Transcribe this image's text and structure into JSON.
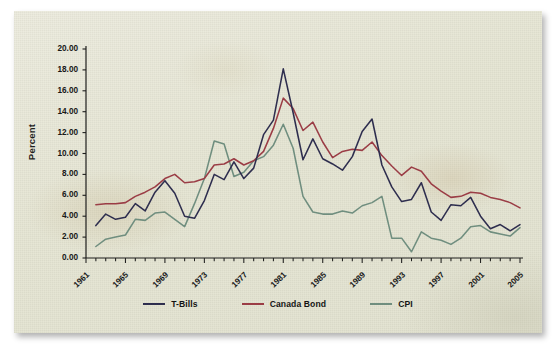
{
  "figure": {
    "background_color": "#e8e8d8",
    "y_axis_title": "Percent"
  },
  "legend": {
    "items": [
      {
        "label": "T-Bills",
        "color": "#2b2b4e"
      },
      {
        "label": "Canada Bond",
        "color": "#9c3a44"
      },
      {
        "label": "CPI",
        "color": "#6f8f80"
      }
    ]
  },
  "chart_data": {
    "type": "line",
    "title": "",
    "subtitle": "",
    "xlabel": "",
    "ylabel": "Percent",
    "ylim": [
      0,
      20
    ],
    "y_ticks": [
      "0.00",
      "2.00",
      "4.00",
      "6.00",
      "8.00",
      "10.00",
      "12.00",
      "14.00",
      "16.00",
      "18.00",
      "20.00"
    ],
    "xlim": [
      1961,
      2005
    ],
    "x_ticks_labeled": [
      "1961",
      "1965",
      "1969",
      "1973",
      "1977",
      "1981",
      "1985",
      "1989",
      "1993",
      "1997",
      "2001",
      "2005"
    ],
    "x_tick_interval_minor": 1,
    "grid": false,
    "legend_position": "bottom",
    "x": [
      1962,
      1963,
      1964,
      1965,
      1966,
      1967,
      1968,
      1969,
      1970,
      1971,
      1972,
      1973,
      1974,
      1975,
      1976,
      1977,
      1978,
      1979,
      1980,
      1981,
      1982,
      1983,
      1984,
      1985,
      1986,
      1987,
      1988,
      1989,
      1990,
      1991,
      1992,
      1993,
      1994,
      1995,
      1996,
      1997,
      1998,
      1999,
      2000,
      2001,
      2002,
      2003,
      2004,
      2005
    ],
    "series": [
      {
        "name": "T-Bills",
        "color": "#2b2b4e",
        "values": [
          3.1,
          4.2,
          3.7,
          3.9,
          5.2,
          4.5,
          6.3,
          7.4,
          6.2,
          4.0,
          3.8,
          5.5,
          8.0,
          7.5,
          9.2,
          7.6,
          8.6,
          11.8,
          13.2,
          18.1,
          13.9,
          9.4,
          11.4,
          9.5,
          9.0,
          8.4,
          9.7,
          12.1,
          13.3,
          8.9,
          6.8,
          5.4,
          5.6,
          7.2,
          4.4,
          3.6,
          5.1,
          5.0,
          5.8,
          4.0,
          2.8,
          3.2,
          2.6,
          3.2
        ]
      },
      {
        "name": "Canada Bond",
        "color": "#9c3a44",
        "values": [
          5.1,
          5.2,
          5.2,
          5.3,
          5.9,
          6.3,
          6.8,
          7.6,
          8.0,
          7.2,
          7.3,
          7.6,
          8.9,
          9.0,
          9.5,
          8.9,
          9.3,
          10.2,
          12.4,
          15.3,
          14.3,
          12.2,
          13.0,
          11.1,
          9.6,
          10.2,
          10.4,
          10.3,
          11.1,
          9.8,
          8.8,
          7.9,
          8.7,
          8.3,
          7.1,
          6.4,
          5.8,
          5.9,
          6.3,
          6.2,
          5.8,
          5.6,
          5.3,
          4.8
        ]
      },
      {
        "name": "CPI",
        "color": "#6f8f80",
        "values": [
          1.1,
          1.8,
          2.0,
          2.2,
          3.7,
          3.6,
          4.3,
          4.4,
          3.7,
          3.0,
          5.2,
          7.6,
          11.2,
          10.9,
          7.8,
          8.2,
          9.3,
          9.7,
          10.8,
          12.8,
          10.5,
          5.9,
          4.4,
          4.2,
          4.2,
          4.5,
          4.3,
          5.0,
          5.3,
          5.9,
          1.9,
          1.9,
          0.6,
          2.5,
          1.9,
          1.7,
          1.3,
          1.9,
          3.0,
          3.1,
          2.5,
          2.3,
          2.1,
          2.9
        ]
      }
    ]
  }
}
